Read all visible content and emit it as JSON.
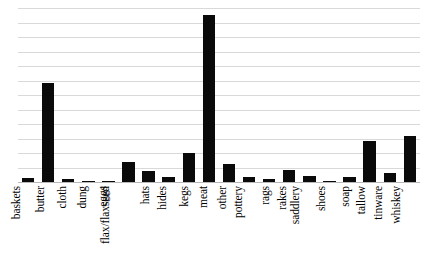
{
  "chart_data": {
    "type": "bar",
    "title": "",
    "subtitle": "",
    "xlabel": "",
    "ylabel": "",
    "legend": [],
    "legend_position": "none",
    "grid": true,
    "gridline_count": 12,
    "orientation": "vertical",
    "bar_color": "#0a0a0a",
    "gridline_color": "#d9d9d9",
    "baseline_color": "#b8b8b8",
    "background_color": "#ffffff",
    "ylim": [
      0,
      1.0
    ],
    "y_tick_labels": [],
    "value_units": "relative frequency (unlabeled axis)",
    "categories": [
      "baskets",
      "butter",
      "cloth",
      "dung",
      "eggs",
      "flax/flaxseed",
      "hats",
      "hides",
      "kegs",
      "meat",
      "other",
      "pottery",
      "rags",
      "rakes",
      "saddlery",
      "shoes",
      "soap",
      "tallow",
      "tinware",
      "whiskey"
    ],
    "values": [
      0.024,
      0.593,
      0.018,
      0.006,
      0.006,
      0.12,
      0.066,
      0.03,
      0.174,
      1.0,
      0.108,
      0.03,
      0.018,
      0.072,
      0.036,
      0.006,
      0.03,
      0.246,
      0.054,
      0.275
    ],
    "bars": [
      {
        "category": "baskets",
        "value": 0.024
      },
      {
        "category": "butter",
        "value": 0.593
      },
      {
        "category": "cloth",
        "value": 0.018
      },
      {
        "category": "dung",
        "value": 0.006
      },
      {
        "category": "eggs",
        "value": 0.006
      },
      {
        "category": "flax/flaxseed",
        "value": 0.12
      },
      {
        "category": "hats",
        "value": 0.066
      },
      {
        "category": "hides",
        "value": 0.03
      },
      {
        "category": "kegs",
        "value": 0.174
      },
      {
        "category": "meat",
        "value": 1.0
      },
      {
        "category": "other",
        "value": 0.108
      },
      {
        "category": "pottery",
        "value": 0.03
      },
      {
        "category": "rags",
        "value": 0.018
      },
      {
        "category": "rakes",
        "value": 0.072
      },
      {
        "category": "saddlery",
        "value": 0.036
      },
      {
        "category": "shoes",
        "value": 0.006
      },
      {
        "category": "soap",
        "value": 0.03
      },
      {
        "category": "tallow",
        "value": 0.246
      },
      {
        "category": "tinware",
        "value": 0.054
      },
      {
        "category": "whiskey",
        "value": 0.275
      }
    ]
  }
}
